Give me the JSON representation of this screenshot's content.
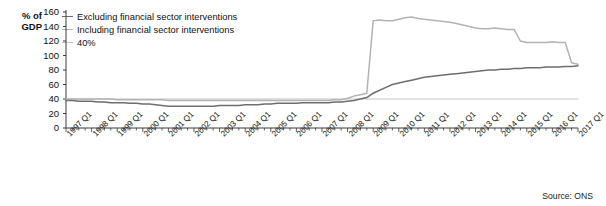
{
  "source_note": "Source: ONS",
  "axis": {
    "y_title": "% of\nGDP",
    "y_ticks": [
      "160",
      "140",
      "120",
      "100",
      "80",
      "60",
      "40",
      "20",
      "0"
    ],
    "x_ticks": [
      "1997 Q1",
      "1998 Q1",
      "1999 Q1",
      "2000 Q1",
      "2001 Q1",
      "2002 Q1",
      "2003 Q1",
      "2004 Q1",
      "2005 Q1",
      "2006 Q1",
      "2007 Q1",
      "2008 Q1",
      "2009 Q1",
      "2010 Q1",
      "2011 Q1",
      "2012 Q1",
      "2013 Q1",
      "2014 Q1",
      "2015 Q1",
      "2016 Q1",
      "2017 Q1"
    ]
  },
  "legend": {
    "items": [
      {
        "label": "Excluding financial sector interventions",
        "color": "#6e6e6e"
      },
      {
        "label": "Including financial sector interventions",
        "color": "#b3b3b3"
      },
      {
        "label": "40%",
        "color": "#c4c4c4"
      }
    ]
  },
  "chart_data": {
    "type": "line",
    "title": "",
    "subtitle": "",
    "xlabel": "",
    "ylabel": "% of GDP",
    "ylim": [
      0,
      160
    ],
    "ytick_step": 20,
    "grid": false,
    "legend_position": "top-left",
    "x_start": "1997 Q1",
    "x_end": "2017 Q1",
    "x_frequency": "quarterly",
    "x": [
      "1997 Q1",
      "1997 Q2",
      "1997 Q3",
      "1997 Q4",
      "1998 Q1",
      "1998 Q2",
      "1998 Q3",
      "1998 Q4",
      "1999 Q1",
      "1999 Q2",
      "1999 Q3",
      "1999 Q4",
      "2000 Q1",
      "2000 Q2",
      "2000 Q3",
      "2000 Q4",
      "2001 Q1",
      "2001 Q2",
      "2001 Q3",
      "2001 Q4",
      "2002 Q1",
      "2002 Q2",
      "2002 Q3",
      "2002 Q4",
      "2003 Q1",
      "2003 Q2",
      "2003 Q3",
      "2003 Q4",
      "2004 Q1",
      "2004 Q2",
      "2004 Q3",
      "2004 Q4",
      "2005 Q1",
      "2005 Q2",
      "2005 Q3",
      "2005 Q4",
      "2006 Q1",
      "2006 Q2",
      "2006 Q3",
      "2006 Q4",
      "2007 Q1",
      "2007 Q2",
      "2007 Q3",
      "2007 Q4",
      "2008 Q1",
      "2008 Q2",
      "2008 Q3",
      "2008 Q4",
      "2009 Q1",
      "2009 Q2",
      "2009 Q3",
      "2009 Q4",
      "2010 Q1",
      "2010 Q2",
      "2010 Q3",
      "2010 Q4",
      "2011 Q1",
      "2011 Q2",
      "2011 Q3",
      "2011 Q4",
      "2012 Q1",
      "2012 Q2",
      "2012 Q3",
      "2012 Q4",
      "2013 Q1",
      "2013 Q2",
      "2013 Q3",
      "2013 Q4",
      "2014 Q1",
      "2014 Q2",
      "2014 Q3",
      "2014 Q4",
      "2015 Q1",
      "2015 Q2",
      "2015 Q3",
      "2015 Q4",
      "2016 Q1",
      "2016 Q2",
      "2016 Q3",
      "2016 Q4",
      "2017 Q1"
    ],
    "series": [
      {
        "name": "Excluding financial sector interventions",
        "color": "#6e6e6e",
        "values": [
          38,
          38,
          37,
          37,
          37,
          36,
          36,
          35,
          35,
          35,
          34,
          34,
          33,
          33,
          32,
          31,
          30,
          30,
          30,
          30,
          30,
          30,
          30,
          30,
          31,
          31,
          31,
          31,
          32,
          32,
          32,
          33,
          33,
          34,
          34,
          34,
          34,
          35,
          35,
          35,
          35,
          35,
          36,
          36,
          37,
          38,
          40,
          42,
          48,
          52,
          56,
          60,
          62,
          64,
          66,
          68,
          70,
          71,
          72,
          73,
          74,
          75,
          76,
          77,
          78,
          79,
          80,
          80,
          81,
          81,
          82,
          82,
          83,
          83,
          83,
          84,
          84,
          84,
          85,
          85,
          86
        ]
      },
      {
        "name": "Including financial sector interventions",
        "color": "#b3b3b3",
        "values": [
          40,
          40,
          40,
          40,
          40,
          40,
          40,
          40,
          39,
          39,
          39,
          39,
          39,
          39,
          39,
          39,
          38,
          38,
          38,
          38,
          38,
          38,
          38,
          38,
          38,
          38,
          38,
          38,
          38,
          38,
          38,
          38,
          38,
          38,
          38,
          38,
          38,
          38,
          38,
          38,
          38,
          38,
          39,
          39,
          41,
          44,
          46,
          48,
          148,
          149,
          148,
          148,
          150,
          152,
          153,
          151,
          150,
          149,
          148,
          147,
          146,
          144,
          142,
          140,
          138,
          137,
          137,
          138,
          137,
          136,
          136,
          120,
          118,
          118,
          118,
          118,
          119,
          118,
          118,
          90,
          88
        ]
      },
      {
        "name": "40%",
        "color": "#c4c4c4",
        "constant": 40,
        "values": [
          40,
          40,
          40,
          40,
          40,
          40,
          40,
          40,
          40,
          40,
          40,
          40,
          40,
          40,
          40,
          40,
          40,
          40,
          40,
          40,
          40,
          40,
          40,
          40,
          40,
          40,
          40,
          40,
          40,
          40,
          40,
          40,
          40,
          40,
          40,
          40,
          40,
          40,
          40,
          40,
          40,
          40,
          40,
          40,
          40,
          40,
          40,
          40,
          40,
          40,
          40,
          40,
          40,
          40,
          40,
          40,
          40,
          40,
          40,
          40,
          40,
          40,
          40,
          40,
          40,
          40,
          40,
          40,
          40,
          40,
          40,
          40,
          40,
          40,
          40,
          40,
          40,
          40,
          40,
          40,
          40
        ]
      }
    ]
  }
}
